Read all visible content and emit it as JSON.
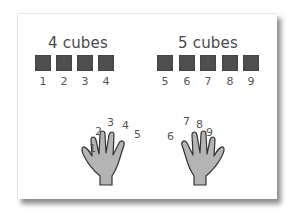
{
  "left_group": {
    "title": "4 cubes",
    "cube_labels": [
      "1",
      "2",
      "3",
      "4"
    ]
  },
  "right_group": {
    "title": "5 cubes",
    "cube_labels": [
      "5",
      "6",
      "7",
      "8",
      "9"
    ]
  },
  "left_hand": {
    "finger_labels": [
      "1",
      "2",
      "3",
      "4",
      "5"
    ]
  },
  "right_hand": {
    "finger_labels": [
      "6",
      "7",
      "8",
      "9"
    ]
  },
  "colors": {
    "cube": "#4f4f4f",
    "hand_fill": "#b4b4b4",
    "hand_outline": "#333333",
    "text": "#4a4a4a"
  }
}
